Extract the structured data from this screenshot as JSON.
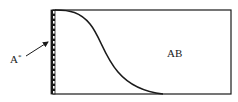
{
  "diagram": {
    "type": "concentration-profile",
    "labels": {
      "wall_label_base": "A",
      "wall_label_sup": "*",
      "region_label": "AB"
    },
    "colors": {
      "stroke": "#1a1a1a",
      "background": "#ffffff"
    },
    "box": {
      "x": 51,
      "y": 10,
      "width": 180,
      "height": 84
    },
    "hatched_wall": {
      "x": 51,
      "y": 10,
      "width": 4,
      "height": 84
    },
    "curve": {
      "description": "S-shaped profile starting at top-left of wall, decaying to bottom edge",
      "start": [
        55,
        10
      ],
      "end": [
        163,
        94
      ]
    },
    "arrow": {
      "from": [
        26,
        56
      ],
      "to": [
        49,
        41
      ]
    }
  }
}
